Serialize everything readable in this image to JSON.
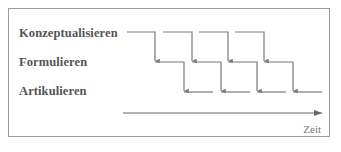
{
  "diagram": {
    "rows": [
      {
        "label": "Konzeptualisieren"
      },
      {
        "label": "Formulieren"
      },
      {
        "label": "Artikulieren"
      }
    ],
    "axis_label": "Zeit",
    "stroke_color": "#7a7a7a",
    "stages_per_row": 4
  }
}
